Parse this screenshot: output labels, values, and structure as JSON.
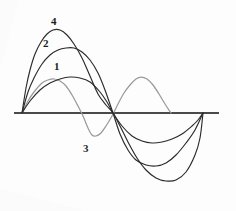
{
  "figure": {
    "background_color": "#fdfdfd",
    "axis_color": "#4a4a4a",
    "curve_dark_color": "#2b2b2b",
    "curve_light_color": "#9a9a9a",
    "title": ""
  },
  "chart_data": {
    "type": "line",
    "title": "",
    "xlabel": "",
    "ylabel": "",
    "grid": false,
    "legend": "inline-curve-labels",
    "xlim": [
      0,
      6.283185
    ],
    "ylim": [
      -1.15,
      1.15
    ],
    "axis": {
      "baseline_y": 0,
      "baseline_x_start_px": 14,
      "baseline_x_end_px": 219,
      "baseline_y_px": 113,
      "origin_x_px": 22,
      "zero_crossing_x_px": 113,
      "end_x_px": 203
    },
    "annotations": [
      {
        "label": "4",
        "x_px": 51,
        "y_px": 16,
        "anchor_curve": "4"
      },
      {
        "label": "2",
        "x_px": 43,
        "y_px": 38,
        "anchor_curve": "2"
      },
      {
        "label": "1",
        "x_px": 54,
        "y_px": 61,
        "anchor_curve": "1"
      },
      {
        "label": "3",
        "x_px": 83,
        "y_px": 143,
        "anchor_curve": "3"
      }
    ],
    "series": [
      {
        "name": "1",
        "color": "#2b2b2b",
        "description": "low-amplitude sine, first lobe peak ~0.38, second lobe trough ~-0.40",
        "peak_px": {
          "x": 70,
          "y": 78
        },
        "trough_px": {
          "x": 155,
          "y": 143
        },
        "points_px": [
          [
            22,
            113
          ],
          [
            30,
            101
          ],
          [
            40,
            90
          ],
          [
            50,
            83
          ],
          [
            60,
            79
          ],
          [
            70,
            77
          ],
          [
            80,
            78
          ],
          [
            90,
            82
          ],
          [
            100,
            92
          ],
          [
            107,
            102
          ],
          [
            113,
            113
          ],
          [
            122,
            126
          ],
          [
            132,
            136
          ],
          [
            142,
            141
          ],
          [
            152,
            143
          ],
          [
            162,
            142
          ],
          [
            172,
            139
          ],
          [
            182,
            134
          ],
          [
            192,
            126
          ],
          [
            198,
            120
          ],
          [
            203,
            113
          ]
        ]
      },
      {
        "name": "2",
        "color": "#2b2b2b",
        "description": "mid-amplitude sine, first lobe peak ~0.72, second lobe trough ~-0.73",
        "peak_px": {
          "x": 72,
          "y": 48
        },
        "trough_px": {
          "x": 162,
          "y": 165
        },
        "points_px": [
          [
            22,
            113
          ],
          [
            28,
            92
          ],
          [
            34,
            78
          ],
          [
            42,
            64
          ],
          [
            50,
            55
          ],
          [
            58,
            50
          ],
          [
            66,
            48
          ],
          [
            74,
            48
          ],
          [
            82,
            52
          ],
          [
            90,
            60
          ],
          [
            98,
            73
          ],
          [
            105,
            90
          ],
          [
            113,
            113
          ],
          [
            120,
            134
          ],
          [
            128,
            150
          ],
          [
            136,
            160
          ],
          [
            146,
            165
          ],
          [
            156,
            166
          ],
          [
            166,
            163
          ],
          [
            176,
            155
          ],
          [
            186,
            143
          ],
          [
            195,
            130
          ],
          [
            203,
            113
          ]
        ]
      },
      {
        "name": "3",
        "color": "#9a9a9a",
        "description": "higher-frequency light-gray sine (two full lobes), amplitude ~0.37",
        "peak1_px": {
          "x": 52,
          "y": 79
        },
        "trough1_px": {
          "x": 91,
          "y": 136
        },
        "peak2_px": {
          "x": 140,
          "y": 78
        },
        "points_px": [
          [
            22,
            113
          ],
          [
            28,
            101
          ],
          [
            34,
            92
          ],
          [
            42,
            83
          ],
          [
            48,
            80
          ],
          [
            54,
            79
          ],
          [
            60,
            81
          ],
          [
            66,
            86
          ],
          [
            72,
            95
          ],
          [
            78,
            106
          ],
          [
            83,
            116
          ],
          [
            88,
            128
          ],
          [
            92,
            135
          ],
          [
            96,
            136
          ],
          [
            101,
            133
          ],
          [
            106,
            126
          ],
          [
            112,
            116
          ],
          [
            118,
            104
          ],
          [
            124,
            93
          ],
          [
            130,
            85
          ],
          [
            136,
            79
          ],
          [
            141,
            77
          ],
          [
            147,
            79
          ],
          [
            153,
            85
          ],
          [
            159,
            94
          ],
          [
            165,
            104
          ],
          [
            171,
            113
          ]
        ]
      },
      {
        "name": "4",
        "color": "#2b2b2b",
        "description": "largest-amplitude sine, first lobe peak ~0.86, second lobe trough ~-0.88",
        "peak_px": {
          "x": 54,
          "y": 30
        },
        "trough_px": {
          "x": 172,
          "y": 181
        },
        "points_px": [
          [
            22,
            113
          ],
          [
            26,
            88
          ],
          [
            30,
            70
          ],
          [
            35,
            54
          ],
          [
            41,
            42
          ],
          [
            47,
            34
          ],
          [
            53,
            30
          ],
          [
            60,
            30
          ],
          [
            67,
            35
          ],
          [
            74,
            44
          ],
          [
            82,
            58
          ],
          [
            90,
            76
          ],
          [
            98,
            94
          ],
          [
            106,
            105
          ],
          [
            113,
            113
          ],
          [
            120,
            126
          ],
          [
            128,
            142
          ],
          [
            137,
            158
          ],
          [
            146,
            170
          ],
          [
            156,
            178
          ],
          [
            166,
            181
          ],
          [
            176,
            180
          ],
          [
            186,
            172
          ],
          [
            195,
            155
          ],
          [
            200,
            138
          ],
          [
            203,
            113
          ]
        ]
      }
    ]
  }
}
